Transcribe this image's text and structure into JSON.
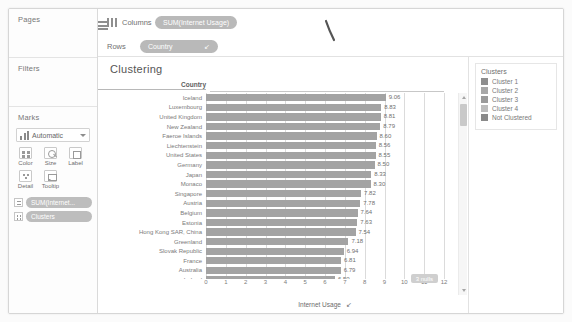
{
  "sidebar": {
    "pages_label": "Pages",
    "filters_label": "Filters",
    "marks_label": "Marks",
    "marks_type": "Automatic",
    "mark_buttons": [
      {
        "label": "Color",
        "icon": "color-icon"
      },
      {
        "label": "Size",
        "icon": "size-icon"
      },
      {
        "label": "Label",
        "icon": "label-icon"
      },
      {
        "label": "Detail",
        "icon": "detail-icon"
      },
      {
        "label": "Tooltip",
        "icon": "tooltip-icon"
      }
    ],
    "marks_pills": [
      {
        "label": "SUM(Internet...",
        "icon": "abc-icon"
      },
      {
        "label": "Clusters",
        "icon": "dots-icon"
      }
    ]
  },
  "shelves": {
    "columns_label": "Columns",
    "columns_pill": "SUM(Internet Usage)",
    "rows_label": "Rows",
    "rows_pill": "Country",
    "rows_pill_sort_icon": "sort-descending-icon"
  },
  "view": {
    "title": "Clustering",
    "column_header": "Country",
    "nulls_badge": "3 nulls",
    "bar_color": "#a3a3a3"
  },
  "legend": {
    "title": "Clusters",
    "items": [
      {
        "label": "Cluster 1",
        "color": "#8e8e8e"
      },
      {
        "label": "Cluster 2",
        "color": "#a8a8a8"
      },
      {
        "label": "Cluster 3",
        "color": "#9b9b9b"
      },
      {
        "label": "Cluster 4",
        "color": "#bdbdbd"
      },
      {
        "label": "Not Clustered",
        "color": "#8a8a8a"
      }
    ]
  },
  "chart_data": {
    "type": "bar",
    "title": "Clustering",
    "xlabel": "Internet Usage",
    "ylabel": "Country",
    "xlim": [
      0,
      12
    ],
    "xticks": [
      0,
      1,
      2,
      3,
      4,
      5,
      6,
      7,
      8,
      9,
      10,
      11,
      12
    ],
    "grid": true,
    "orientation": "horizontal",
    "legend_position": "right",
    "categories": [
      "Iceland",
      "Luxembourg",
      "United Kingdom",
      "New Zealand",
      "Faeroe Islands",
      "Liechtenstein",
      "United States",
      "Germany",
      "Japan",
      "Monaco",
      "Singapore",
      "Austria",
      "Belgium",
      "Estonia",
      "Hong Kong SAR, China",
      "Greenland",
      "Slovak Republic",
      "France",
      "Australia",
      "Ireland"
    ],
    "values": [
      9.06,
      8.83,
      8.81,
      8.79,
      8.6,
      8.56,
      8.55,
      8.5,
      8.33,
      8.3,
      7.82,
      7.78,
      7.64,
      7.63,
      7.54,
      7.18,
      6.94,
      6.81,
      6.79,
      6.5
    ],
    "value_labels": [
      "9.06",
      "8.83",
      "8.81",
      "8.79",
      "8.60",
      "8.56",
      "8.55",
      "8.50",
      "8.33",
      "8.30",
      "7.82",
      "7.78",
      "7.64",
      "7.63",
      "7.54",
      "7.18",
      "6.94",
      "6.81",
      "6.79",
      "6.50"
    ]
  }
}
